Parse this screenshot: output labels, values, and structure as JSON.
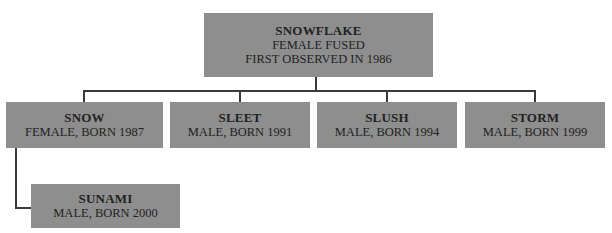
{
  "diagram": {
    "type": "family-tree",
    "root": {
      "name": "SNOWFLAKE",
      "lines": [
        "FEMALE FUSED",
        "FIRST OBSERVED IN 1986"
      ]
    },
    "children": [
      {
        "name": "SNOW",
        "detail": "FEMALE, BORN 1987"
      },
      {
        "name": "SLEET",
        "detail": "MALE, BORN 1991"
      },
      {
        "name": "SLUSH",
        "detail": "MALE, BORN 1994"
      },
      {
        "name": "STORM",
        "detail": "MALE, BORN 1999"
      }
    ],
    "grandchildren": [
      {
        "parent": "SNOW",
        "name": "SUNAMI",
        "detail": "MALE, BORN 2000"
      }
    ],
    "colors": {
      "box_fill": "#8e8e8e",
      "connector": "#3a3a3a",
      "text": "#222222"
    }
  }
}
